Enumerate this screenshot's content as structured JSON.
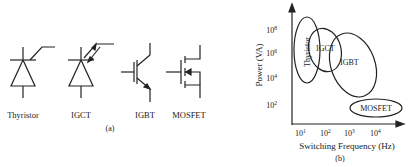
{
  "panel_a": {
    "caption": "(a)",
    "devices": [
      {
        "name": "Thyristor"
      },
      {
        "name": "IGCT"
      },
      {
        "name": "IGBT"
      },
      {
        "name": "MOSFET"
      }
    ]
  },
  "panel_b": {
    "caption": "(b)",
    "ylabel": "Power (VA)",
    "xlabel": "Switching Frequency (Hz)",
    "yticks": [
      {
        "base": "10",
        "exp": "8"
      },
      {
        "base": "10",
        "exp": "6"
      },
      {
        "base": "10",
        "exp": "4"
      },
      {
        "base": "10",
        "exp": "2"
      }
    ],
    "xticks": [
      {
        "base": "10",
        "exp": "1"
      },
      {
        "base": "10",
        "exp": "2"
      },
      {
        "base": "10",
        "exp": "3"
      },
      {
        "base": "10",
        "exp": "4"
      }
    ],
    "regions": [
      {
        "label": "Thyristor"
      },
      {
        "label": "IGCT"
      },
      {
        "label": "IGBT"
      },
      {
        "label": "MOSFET"
      }
    ]
  }
}
